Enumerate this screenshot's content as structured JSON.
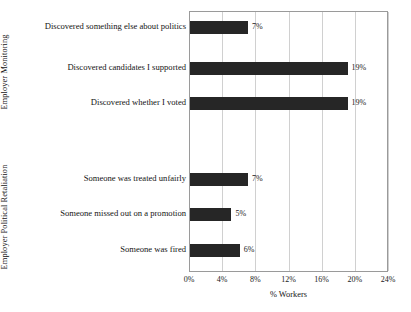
{
  "chart_data": {
    "type": "bar",
    "orientation": "horizontal",
    "title": "",
    "xlabel": "% Workers",
    "ylabel": "",
    "xlim": [
      0,
      24
    ],
    "grid": true,
    "legend": false,
    "xticks": [
      "0%",
      "4%",
      "8%",
      "12%",
      "16%",
      "20%",
      "24%"
    ],
    "xtick_values": [
      0,
      4,
      8,
      12,
      16,
      20,
      24
    ],
    "groups": [
      {
        "name": "Employer Monitoring",
        "categories": [
          "Discovered something else about politics",
          "Discovered candidates I supported",
          "Discovered whether I voted"
        ],
        "values": [
          7,
          19,
          19
        ],
        "value_labels": [
          "7%",
          "19%",
          "19%"
        ]
      },
      {
        "name": "Employer Political Retaliation",
        "categories": [
          "Someone was treated unfairly",
          "Someone missed out on a promotion",
          "Someone was fired"
        ],
        "values": [
          7,
          5,
          6
        ],
        "value_labels": [
          "7%",
          "5%",
          "6%"
        ]
      }
    ],
    "bar_color": "#262626",
    "grid_color": "#d0d0d0",
    "axis_color": "#9a9a9a"
  },
  "axis": {
    "x_title": "% Workers"
  },
  "bars": [
    {
      "label": "Discovered something else about politics",
      "value": 7,
      "value_label": "7%",
      "top": 20
    },
    {
      "label": "Discovered candidates I supported",
      "value": 19,
      "value_label": "19%",
      "top": 61
    },
    {
      "label": "Discovered whether I voted",
      "value": 19,
      "value_label": "19%",
      "top": 96
    },
    {
      "label": "Someone was treated unfairly",
      "value": 7,
      "value_label": "7%",
      "top": 172
    },
    {
      "label": "Someone missed out on a promotion",
      "value": 5,
      "value_label": "5%",
      "top": 207
    },
    {
      "label": "Someone was fired",
      "value": 6,
      "value_label": "6%",
      "top": 243
    }
  ],
  "groups": [
    {
      "name": "Employer Monitoring",
      "center_y": 63
    },
    {
      "name": "Employer Political Retaliation",
      "center_y": 208
    }
  ],
  "xticks": [
    {
      "label": "0%",
      "value": 0
    },
    {
      "label": "4%",
      "value": 4
    },
    {
      "label": "8%",
      "value": 8
    },
    {
      "label": "12%",
      "value": 12
    },
    {
      "label": "16%",
      "value": 16
    },
    {
      "label": "20%",
      "value": 20
    },
    {
      "label": "24%",
      "value": 24
    }
  ]
}
